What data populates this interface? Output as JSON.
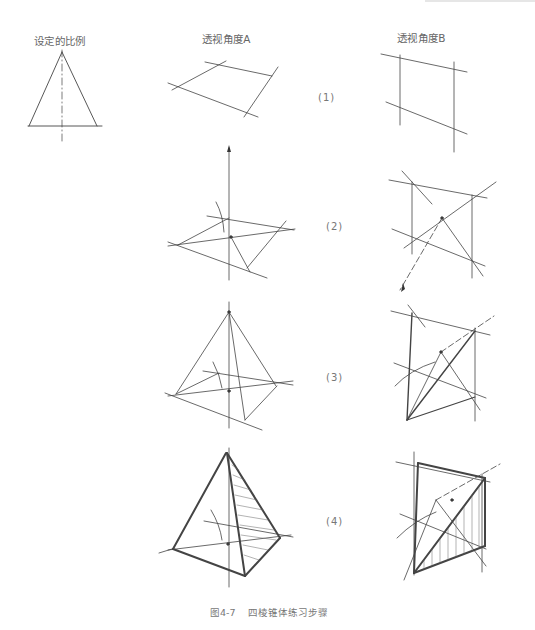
{
  "columns": {
    "proportion": "设定的比例",
    "perspective_a": "透视角度A",
    "perspective_b": "透视角度B"
  },
  "steps": [
    {
      "label": "(1)"
    },
    {
      "label": "(2)"
    },
    {
      "label": "(3)"
    },
    {
      "label": "(4)"
    }
  ],
  "caption": {
    "figure_number": "图4-7",
    "title": "四棱锥体练习步骤"
  },
  "colors": {
    "line": "#444444",
    "text": "#666666",
    "background": "#ffffff"
  }
}
